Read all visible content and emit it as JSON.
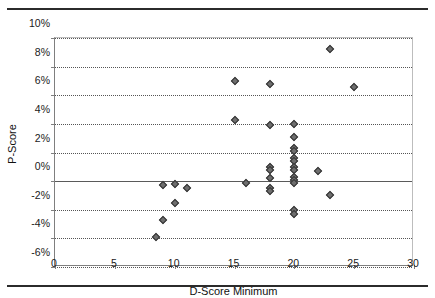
{
  "chart_data": {
    "type": "scatter",
    "title": "",
    "xlabel": "D-Score Minimum",
    "ylabel": "P-Score",
    "xlim": [
      0,
      30
    ],
    "ylim": [
      -0.06,
      0.1
    ],
    "xticks": [
      0,
      5,
      10,
      15,
      20,
      25,
      30
    ],
    "xtick_labels": [
      "0",
      "5",
      "10",
      "15",
      "20",
      "25",
      "30"
    ],
    "yticks": [
      0.1,
      0.08,
      0.06,
      0.04,
      0.02,
      0.0,
      -0.02,
      -0.04,
      -0.06
    ],
    "ytick_labels": [
      "10%",
      "8%",
      "6%",
      "4%",
      "2%",
      "0%",
      "-2%",
      "-4%",
      "-6%"
    ],
    "grid": true,
    "grid_axis": "y",
    "legend": false,
    "marker": "diamond",
    "marker_color": "#6e6e6e",
    "marker_edge_color": "#333333",
    "series": [
      {
        "name": "P-Score vs D-Score Minimum",
        "points": [
          [
            8.4,
            -0.039
          ],
          [
            9.0,
            -0.027
          ],
          [
            9.0,
            -0.003
          ],
          [
            10.0,
            -0.015
          ],
          [
            10.0,
            -0.002
          ],
          [
            11.0,
            -0.005
          ],
          [
            15.0,
            0.07
          ],
          [
            15.0,
            0.043
          ],
          [
            16.0,
            -0.001
          ],
          [
            18.0,
            0.068
          ],
          [
            18.0,
            0.039
          ],
          [
            18.0,
            0.01
          ],
          [
            18.0,
            0.008
          ],
          [
            18.0,
            0.002
          ],
          [
            18.0,
            -0.005
          ],
          [
            18.0,
            -0.007
          ],
          [
            20.0,
            0.04
          ],
          [
            20.0,
            0.031
          ],
          [
            20.0,
            0.023
          ],
          [
            20.0,
            0.021
          ],
          [
            20.0,
            0.016
          ],
          [
            20.0,
            0.014
          ],
          [
            20.0,
            0.01
          ],
          [
            20.0,
            0.008
          ],
          [
            20.0,
            0.003
          ],
          [
            20.0,
            0.001
          ],
          [
            20.0,
            -0.001
          ],
          [
            20.0,
            -0.02
          ],
          [
            20.0,
            -0.023
          ],
          [
            22.0,
            0.007
          ],
          [
            23.0,
            0.092
          ],
          [
            23.0,
            -0.01
          ],
          [
            25.0,
            0.066
          ]
        ]
      }
    ]
  },
  "figure": {
    "top_rule": "",
    "bottom_rule": ""
  }
}
